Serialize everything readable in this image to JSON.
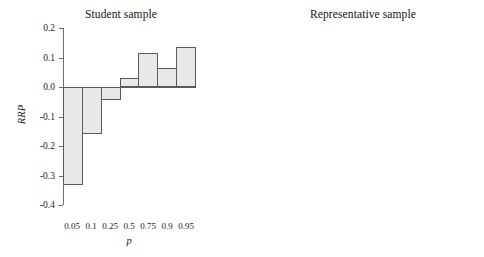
{
  "figure": {
    "background": "#ffffff",
    "bar_fill": "#e8e8e6",
    "bar_stroke": "#5a5a5a",
    "axis_color": "#6e6e6e"
  },
  "panels": [
    {
      "key": "student",
      "title": "Student sample",
      "xlabel": "p",
      "ylabel": "RRP",
      "y_ticks": [
        "0.2",
        "0.1",
        "0.0",
        "-0.1",
        "-0.2",
        "-0.3",
        "-0.4"
      ],
      "x_ticks": [
        "0.05",
        "0.1",
        "0.25",
        "0.5",
        "0.75",
        "0.9",
        "0.95"
      ]
    },
    {
      "key": "representative",
      "title": "Representative sample",
      "xlabel": "p",
      "ylabel": "RRP",
      "y_ticks": [
        "0.2",
        "0.1",
        "0.0",
        "-0.1",
        "-0.2"
      ],
      "x_ticks": [
        "0.05",
        "0.1",
        "0.25",
        "0.5",
        "0.75",
        "0.9",
        "0.95"
      ]
    }
  ],
  "chart_data": [
    {
      "type": "bar",
      "title": "Student sample",
      "xlabel": "p",
      "ylabel": "RRP",
      "categories": [
        "0.05",
        "0.1",
        "0.25",
        "0.5",
        "0.75",
        "0.9",
        "0.95"
      ],
      "values": [
        -0.333,
        -0.16,
        -0.045,
        0.03,
        0.115,
        0.066,
        0.135
      ],
      "ylim": [
        -0.4,
        0.2
      ],
      "ytick_values": [
        0.2,
        0.1,
        0.0,
        -0.1,
        -0.2,
        -0.3,
        -0.4
      ],
      "grid": false,
      "legend": "none"
    },
    {
      "type": "bar",
      "title": "Representative sample",
      "xlabel": "p",
      "ylabel": "RRP",
      "categories": [
        "0.05",
        "0.1",
        "0.25",
        "0.5",
        "0.75",
        "0.9",
        "0.95"
      ],
      "values": [
        -0.165,
        -0.16,
        -0.057,
        0.022,
        0.079,
        0.082,
        0.09
      ],
      "ylim": [
        -0.2,
        0.2
      ],
      "ytick_values": [
        0.2,
        0.1,
        0.0,
        -0.1,
        -0.2
      ],
      "grid": false,
      "legend": "none"
    }
  ]
}
